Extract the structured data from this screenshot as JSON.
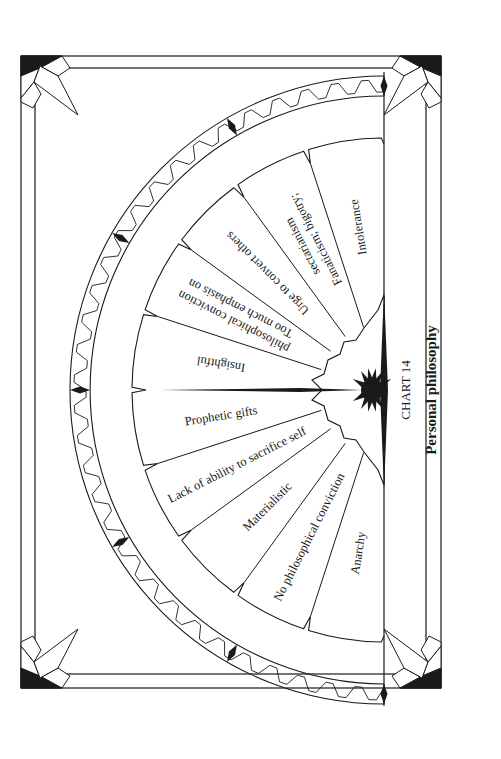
{
  "chart": {
    "number_label": "CHART 14",
    "title": "Personal philosophy",
    "colors": {
      "ink": "#1a1a1a",
      "paper": "#ffffff"
    }
  },
  "segments": [
    {
      "id": "intolerance",
      "label": "Intolerance",
      "lines": [
        "Intolerance"
      ]
    },
    {
      "id": "fanaticism",
      "label": "Fanaticism; bigotry; sectarianism",
      "lines": [
        "Fanaticism; bigotry;",
        "sectarianism"
      ]
    },
    {
      "id": "urge-to-convert",
      "label": "Urge to convert others",
      "lines": [
        "Urge to convert others"
      ]
    },
    {
      "id": "too-much-emphasis",
      "label": "Too much emphasis on philosophical conviction",
      "lines": [
        "Too much emphasis on",
        "philosophical conviction"
      ]
    },
    {
      "id": "insightful",
      "label": "Insightful",
      "lines": [
        "Insightful"
      ]
    },
    {
      "id": "prophetic-gifts",
      "label": "Prophetic gifts",
      "lines": [
        "Prophetic gifts"
      ]
    },
    {
      "id": "lack-of-sacrifice",
      "label": "Lack of ability to sacrifice self",
      "lines": [
        "Lack of ability to sacrifice self"
      ]
    },
    {
      "id": "materialistic",
      "label": "Materialistic",
      "lines": [
        "Materialistic"
      ]
    },
    {
      "id": "no-conviction",
      "label": "No philosophical conviction",
      "lines": [
        "No philosophical conviction"
      ]
    },
    {
      "id": "anarchy",
      "label": "Anarchy",
      "lines": [
        "Anarchy"
      ]
    }
  ]
}
